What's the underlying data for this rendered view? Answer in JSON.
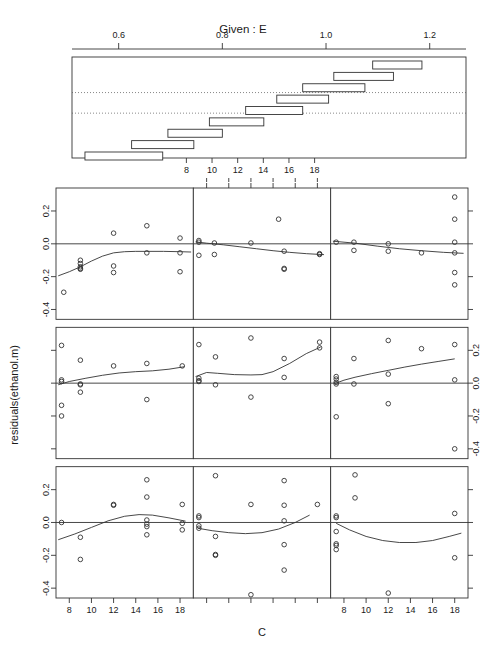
{
  "figure": {
    "kind": "coplot",
    "given_title": "Given :  E",
    "x_axis_label": "C",
    "y_axis_label": "residuals(ethanol.m)",
    "panel_rows": 3,
    "panel_cols": 3,
    "line_color": "#333333",
    "point_color": "#333333",
    "background": "#ffffff"
  },
  "given_panel": {
    "label": "Given :  E",
    "axis_top_ticks": [
      "0.6",
      "0.8",
      "1.0",
      "1.2"
    ],
    "axis_top_values": [
      0.6,
      0.8,
      1.0,
      1.2
    ],
    "axis_bottom_ticks": [
      "8",
      "10",
      "12",
      "14",
      "16",
      "18"
    ],
    "axis_bottom_values": [
      8,
      10,
      12,
      14,
      16,
      18
    ],
    "xlim": [
      0.51,
      1.27
    ],
    "intervals": [
      {
        "index": 1,
        "lo": 0.535,
        "hi": 0.685,
        "row": 1
      },
      {
        "index": 2,
        "lo": 0.625,
        "hi": 0.745,
        "row": 2
      },
      {
        "index": 3,
        "lo": 0.695,
        "hi": 0.8,
        "row": 3
      },
      {
        "index": 4,
        "lo": 0.775,
        "hi": 0.88,
        "row": 4
      },
      {
        "index": 5,
        "lo": 0.845,
        "hi": 0.955,
        "row": 5
      },
      {
        "index": 6,
        "lo": 0.905,
        "hi": 1.005,
        "row": 6
      },
      {
        "index": 7,
        "lo": 0.955,
        "hi": 1.075,
        "row": 7
      },
      {
        "index": 8,
        "lo": 1.015,
        "hi": 1.13,
        "row": 8
      },
      {
        "index": 9,
        "lo": 1.09,
        "hi": 1.185,
        "row": 9
      }
    ],
    "dotted_guides": [
      0.352,
      0.556
    ]
  },
  "chart_data": {
    "type": "scatter",
    "title": "Given :  E",
    "xlabel": "C",
    "ylabel": "residuals(ethanol.m)",
    "xlim": [
      6.8,
      19.2
    ],
    "ylim": [
      -0.46,
      0.34
    ],
    "x_ticks": [
      8,
      10,
      12,
      14,
      16,
      18
    ],
    "y_ticks": [
      -0.4,
      -0.2,
      0.0,
      0.2
    ],
    "y_tick_labels": [
      "-0.4",
      "-0.2",
      "0.0",
      "0.2"
    ],
    "grid": false,
    "legend": "none",
    "reference_line_y": 0.0,
    "panels": [
      {
        "id": "r1c1",
        "row": 1,
        "col": 1,
        "given_interval": [
          1.09,
          1.185
        ],
        "points": [
          {
            "x": 7.5,
            "y": -0.295
          },
          {
            "x": 9.0,
            "y": -0.1
          },
          {
            "x": 9.0,
            "y": -0.12
          },
          {
            "x": 9.0,
            "y": -0.14
          },
          {
            "x": 9.0,
            "y": -0.15
          },
          {
            "x": 9.0,
            "y": -0.155
          },
          {
            "x": 12.0,
            "y": 0.065
          },
          {
            "x": 12.0,
            "y": -0.135
          },
          {
            "x": 12.0,
            "y": -0.175
          },
          {
            "x": 15.0,
            "y": 0.11
          },
          {
            "x": 15.0,
            "y": -0.055
          },
          {
            "x": 18.0,
            "y": 0.035
          },
          {
            "x": 18.0,
            "y": -0.055
          },
          {
            "x": 18.0,
            "y": -0.17
          }
        ],
        "smooth": [
          {
            "x": 7.0,
            "y": -0.195
          },
          {
            "x": 8.0,
            "y": -0.17
          },
          {
            "x": 9.0,
            "y": -0.14
          },
          {
            "x": 10.0,
            "y": -0.105
          },
          {
            "x": 11.0,
            "y": -0.075
          },
          {
            "x": 12.0,
            "y": -0.055
          },
          {
            "x": 13.0,
            "y": -0.048
          },
          {
            "x": 14.0,
            "y": -0.046
          },
          {
            "x": 15.0,
            "y": -0.046
          },
          {
            "x": 16.5,
            "y": -0.046
          },
          {
            "x": 18.0,
            "y": -0.048
          },
          {
            "x": 19.0,
            "y": -0.05
          }
        ]
      },
      {
        "id": "r1c2",
        "row": 1,
        "col": 2,
        "given_interval": [
          1.015,
          1.13
        ],
        "points": [
          {
            "x": 7.3,
            "y": 0.02
          },
          {
            "x": 7.3,
            "y": 0.01
          },
          {
            "x": 7.3,
            "y": -0.07
          },
          {
            "x": 8.7,
            "y": 0.005
          },
          {
            "x": 8.7,
            "y": -0.065
          },
          {
            "x": 12.0,
            "y": 0.005
          },
          {
            "x": 14.5,
            "y": 0.15
          },
          {
            "x": 15.0,
            "y": -0.045
          },
          {
            "x": 15.0,
            "y": -0.15
          },
          {
            "x": 15.0,
            "y": -0.155
          },
          {
            "x": 18.2,
            "y": -0.06
          },
          {
            "x": 18.2,
            "y": -0.065
          }
        ],
        "smooth": [
          {
            "x": 7.0,
            "y": 0.012
          },
          {
            "x": 8.0,
            "y": 0.004
          },
          {
            "x": 9.5,
            "y": -0.006
          },
          {
            "x": 11.0,
            "y": -0.018
          },
          {
            "x": 12.5,
            "y": -0.03
          },
          {
            "x": 14.0,
            "y": -0.042
          },
          {
            "x": 15.5,
            "y": -0.052
          },
          {
            "x": 17.0,
            "y": -0.06
          },
          {
            "x": 18.6,
            "y": -0.066
          }
        ]
      },
      {
        "id": "r1c3",
        "row": 1,
        "col": 3,
        "given_interval": [
          0.955,
          1.075
        ],
        "points": [
          {
            "x": 7.3,
            "y": 0.01
          },
          {
            "x": 8.9,
            "y": 0.01
          },
          {
            "x": 8.9,
            "y": -0.04
          },
          {
            "x": 12.0,
            "y": 0.0
          },
          {
            "x": 12.0,
            "y": -0.045
          },
          {
            "x": 15.0,
            "y": -0.055
          },
          {
            "x": 18.0,
            "y": 0.285
          },
          {
            "x": 18.0,
            "y": 0.15
          },
          {
            "x": 18.0,
            "y": 0.01
          },
          {
            "x": 18.0,
            "y": -0.055
          },
          {
            "x": 18.0,
            "y": -0.175
          },
          {
            "x": 18.0,
            "y": -0.25
          }
        ],
        "smooth": [
          {
            "x": 7.0,
            "y": 0.016
          },
          {
            "x": 9.0,
            "y": 0.004
          },
          {
            "x": 11.0,
            "y": -0.014
          },
          {
            "x": 13.0,
            "y": -0.03
          },
          {
            "x": 15.0,
            "y": -0.042
          },
          {
            "x": 17.0,
            "y": -0.052
          },
          {
            "x": 18.8,
            "y": -0.058
          }
        ]
      },
      {
        "id": "r2c1",
        "row": 2,
        "col": 1,
        "given_interval": [
          0.905,
          1.005
        ],
        "points": [
          {
            "x": 7.3,
            "y": 0.23
          },
          {
            "x": 7.3,
            "y": 0.02
          },
          {
            "x": 7.3,
            "y": 0.01
          },
          {
            "x": 7.3,
            "y": -0.135
          },
          {
            "x": 7.3,
            "y": -0.2
          },
          {
            "x": 9.0,
            "y": 0.14
          },
          {
            "x": 9.0,
            "y": -0.005
          },
          {
            "x": 9.0,
            "y": -0.01
          },
          {
            "x": 9.0,
            "y": -0.055
          },
          {
            "x": 12.0,
            "y": 0.105
          },
          {
            "x": 15.0,
            "y": 0.12
          },
          {
            "x": 15.0,
            "y": -0.1
          },
          {
            "x": 18.2,
            "y": 0.105
          }
        ],
        "smooth": [
          {
            "x": 7.0,
            "y": -0.01
          },
          {
            "x": 8.0,
            "y": 0.01
          },
          {
            "x": 9.5,
            "y": 0.03
          },
          {
            "x": 11.0,
            "y": 0.048
          },
          {
            "x": 12.5,
            "y": 0.062
          },
          {
            "x": 14.0,
            "y": 0.07
          },
          {
            "x": 15.5,
            "y": 0.075
          },
          {
            "x": 17.0,
            "y": 0.085
          },
          {
            "x": 18.4,
            "y": 0.1
          }
        ]
      },
      {
        "id": "r2c2",
        "row": 2,
        "col": 2,
        "given_interval": [
          0.845,
          0.955
        ],
        "points": [
          {
            "x": 7.3,
            "y": 0.235
          },
          {
            "x": 7.3,
            "y": 0.03
          },
          {
            "x": 7.3,
            "y": 0.015
          },
          {
            "x": 7.3,
            "y": 0.01
          },
          {
            "x": 8.8,
            "y": 0.16
          },
          {
            "x": 8.8,
            "y": -0.01
          },
          {
            "x": 12.0,
            "y": 0.275
          },
          {
            "x": 12.0,
            "y": -0.085
          },
          {
            "x": 15.0,
            "y": 0.15
          },
          {
            "x": 15.0,
            "y": 0.035
          },
          {
            "x": 18.2,
            "y": 0.25
          },
          {
            "x": 18.2,
            "y": 0.215
          }
        ],
        "smooth": [
          {
            "x": 7.0,
            "y": 0.04
          },
          {
            "x": 8.0,
            "y": 0.065
          },
          {
            "x": 9.0,
            "y": 0.06
          },
          {
            "x": 10.5,
            "y": 0.052
          },
          {
            "x": 12.0,
            "y": 0.05
          },
          {
            "x": 13.0,
            "y": 0.052
          },
          {
            "x": 14.0,
            "y": 0.07
          },
          {
            "x": 15.5,
            "y": 0.12
          },
          {
            "x": 17.0,
            "y": 0.18
          },
          {
            "x": 18.3,
            "y": 0.22
          }
        ]
      },
      {
        "id": "r2c3",
        "row": 2,
        "col": 3,
        "given_interval": [
          0.775,
          0.88
        ],
        "points": [
          {
            "x": 7.3,
            "y": 0.04
          },
          {
            "x": 7.3,
            "y": 0.025
          },
          {
            "x": 7.3,
            "y": 0.005
          },
          {
            "x": 7.3,
            "y": -0.005
          },
          {
            "x": 7.3,
            "y": -0.205
          },
          {
            "x": 8.9,
            "y": 0.15
          },
          {
            "x": 8.9,
            "y": -0.005
          },
          {
            "x": 12.0,
            "y": 0.26
          },
          {
            "x": 12.0,
            "y": 0.055
          },
          {
            "x": 12.0,
            "y": -0.125
          },
          {
            "x": 15.0,
            "y": 0.21
          },
          {
            "x": 18.0,
            "y": 0.235
          },
          {
            "x": 18.0,
            "y": 0.02
          },
          {
            "x": 18.0,
            "y": -0.4
          }
        ],
        "smooth": [
          {
            "x": 7.2,
            "y": -0.002
          },
          {
            "x": 8.0,
            "y": 0.018
          },
          {
            "x": 9.0,
            "y": 0.036
          },
          {
            "x": 10.5,
            "y": 0.058
          },
          {
            "x": 12.0,
            "y": 0.078
          },
          {
            "x": 13.5,
            "y": 0.098
          },
          {
            "x": 15.0,
            "y": 0.116
          },
          {
            "x": 16.5,
            "y": 0.132
          },
          {
            "x": 18.0,
            "y": 0.148
          }
        ]
      },
      {
        "id": "r3c1",
        "row": 3,
        "col": 1,
        "given_interval": [
          0.695,
          0.8
        ],
        "points": [
          {
            "x": 7.3,
            "y": 0.0
          },
          {
            "x": 9.0,
            "y": -0.09
          },
          {
            "x": 9.0,
            "y": -0.225
          },
          {
            "x": 12.0,
            "y": 0.11
          },
          {
            "x": 12.0,
            "y": 0.105
          },
          {
            "x": 15.0,
            "y": 0.26
          },
          {
            "x": 15.0,
            "y": 0.155
          },
          {
            "x": 15.0,
            "y": 0.015
          },
          {
            "x": 15.0,
            "y": -0.01
          },
          {
            "x": 15.0,
            "y": -0.025
          },
          {
            "x": 15.0,
            "y": -0.075
          },
          {
            "x": 18.2,
            "y": 0.11
          },
          {
            "x": 18.2,
            "y": -0.005
          },
          {
            "x": 18.2,
            "y": -0.045
          }
        ],
        "smooth": [
          {
            "x": 7.0,
            "y": -0.105
          },
          {
            "x": 8.5,
            "y": -0.07
          },
          {
            "x": 10.0,
            "y": -0.03
          },
          {
            "x": 11.5,
            "y": 0.01
          },
          {
            "x": 13.0,
            "y": 0.038
          },
          {
            "x": 14.3,
            "y": 0.048
          },
          {
            "x": 15.5,
            "y": 0.045
          },
          {
            "x": 17.0,
            "y": 0.028
          },
          {
            "x": 18.5,
            "y": 0.008
          }
        ]
      },
      {
        "id": "r3c2",
        "row": 3,
        "col": 2,
        "given_interval": [
          0.625,
          0.745
        ],
        "points": [
          {
            "x": 7.3,
            "y": 0.04
          },
          {
            "x": 7.3,
            "y": 0.03
          },
          {
            "x": 7.3,
            "y": -0.02
          },
          {
            "x": 7.3,
            "y": -0.035
          },
          {
            "x": 8.8,
            "y": 0.285
          },
          {
            "x": 8.8,
            "y": -0.085
          },
          {
            "x": 8.8,
            "y": -0.195
          },
          {
            "x": 8.8,
            "y": -0.2
          },
          {
            "x": 12.0,
            "y": 0.11
          },
          {
            "x": 12.0,
            "y": -0.44
          },
          {
            "x": 15.0,
            "y": 0.255
          },
          {
            "x": 15.0,
            "y": 0.105
          },
          {
            "x": 15.0,
            "y": 0.01
          },
          {
            "x": 15.0,
            "y": -0.135
          },
          {
            "x": 15.0,
            "y": -0.29
          },
          {
            "x": 18.0,
            "y": 0.11
          }
        ],
        "smooth": [
          {
            "x": 7.2,
            "y": -0.035
          },
          {
            "x": 8.5,
            "y": -0.05
          },
          {
            "x": 10.0,
            "y": -0.062
          },
          {
            "x": 11.5,
            "y": -0.068
          },
          {
            "x": 13.0,
            "y": -0.062
          },
          {
            "x": 14.5,
            "y": -0.04
          },
          {
            "x": 16.0,
            "y": 0.0
          },
          {
            "x": 17.3,
            "y": 0.045
          }
        ]
      },
      {
        "id": "r3c3",
        "row": 3,
        "col": 3,
        "given_interval": [
          0.535,
          0.685
        ],
        "points": [
          {
            "x": 7.3,
            "y": 0.04
          },
          {
            "x": 7.3,
            "y": 0.03
          },
          {
            "x": 7.3,
            "y": -0.055
          },
          {
            "x": 7.3,
            "y": -0.13
          },
          {
            "x": 7.3,
            "y": -0.14
          },
          {
            "x": 7.3,
            "y": -0.165
          },
          {
            "x": 9.0,
            "y": 0.29
          },
          {
            "x": 9.0,
            "y": 0.15
          },
          {
            "x": 12.0,
            "y": -0.43
          },
          {
            "x": 18.0,
            "y": 0.055
          },
          {
            "x": 18.0,
            "y": -0.215
          }
        ],
        "smooth": [
          {
            "x": 7.3,
            "y": -0.005
          },
          {
            "x": 8.5,
            "y": -0.045
          },
          {
            "x": 10.0,
            "y": -0.085
          },
          {
            "x": 11.5,
            "y": -0.11
          },
          {
            "x": 13.0,
            "y": -0.122
          },
          {
            "x": 14.5,
            "y": -0.122
          },
          {
            "x": 16.0,
            "y": -0.11
          },
          {
            "x": 17.5,
            "y": -0.085
          },
          {
            "x": 18.6,
            "y": -0.065
          }
        ]
      }
    ]
  }
}
